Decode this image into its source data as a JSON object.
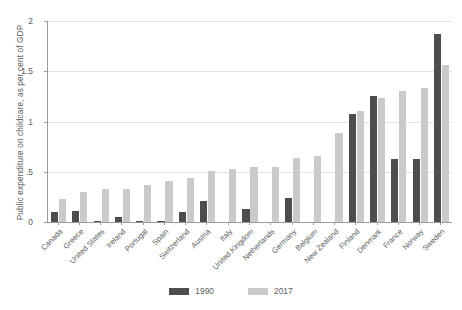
{
  "chart_data": {
    "type": "bar",
    "title": "",
    "subtitle": "",
    "xlabel": "",
    "ylabel": "Public expenditure on childcare, as per cent of GDP",
    "ylim": [
      0,
      2
    ],
    "yticks": [
      "0",
      ".5",
      "1",
      "1.5",
      "2"
    ],
    "ytick_values": [
      0,
      0.5,
      1,
      1.5,
      2
    ],
    "grid": true,
    "legend_position": "bottom",
    "categories": [
      "Canada",
      "Greece",
      "United States",
      "Ireland",
      "Portugal",
      "Spain",
      "Switzerland",
      "Austria",
      "Italy",
      "United Kingdom",
      "Netherlands",
      "Germany",
      "Belgium",
      "New Zealand",
      "Finland",
      "Denmark",
      "France",
      "Norway",
      "Sweden"
    ],
    "series": [
      {
        "name": "1990",
        "color": "#4d4d4f",
        "values": [
          0.1,
          0.11,
          0.01,
          0.05,
          0.01,
          0.01,
          0.1,
          0.21,
          0.0,
          0.13,
          0.0,
          0.24,
          0.0,
          0.0,
          1.07,
          1.25,
          0.63,
          0.63,
          1.87
        ]
      },
      {
        "name": "2017",
        "color": "#cacaca",
        "values": [
          0.23,
          0.3,
          0.33,
          0.33,
          0.37,
          0.41,
          0.44,
          0.51,
          0.53,
          0.55,
          0.55,
          0.64,
          0.66,
          0.89,
          1.1,
          1.23,
          1.3,
          1.33,
          1.56
        ]
      }
    ],
    "legend": [
      {
        "label": "1990",
        "color": "#4d4d4f"
      },
      {
        "label": "2017",
        "color": "#cacaca"
      }
    ],
    "caption": ""
  }
}
